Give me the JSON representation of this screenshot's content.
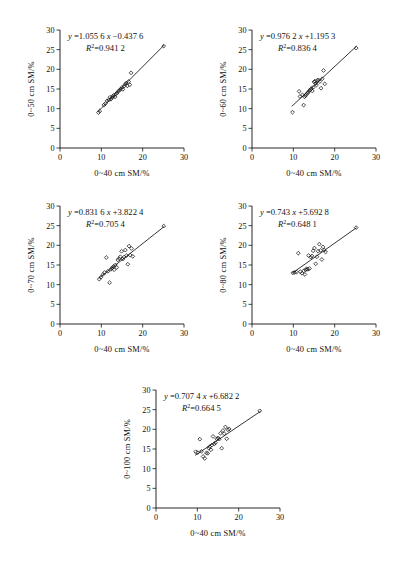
{
  "figure": {
    "background": "#ffffff",
    "ink": "#111111",
    "panel_count": 5
  },
  "axes": {
    "x_ticks": [
      "0",
      "10",
      "20",
      "30"
    ],
    "y_ticks": [
      "0",
      "5",
      "10",
      "15",
      "20",
      "25",
      "30"
    ],
    "x_min": 0,
    "x_max": 30,
    "y_min": 0,
    "y_max": 30,
    "x_label": "0~40 cm  SM/%"
  },
  "chart_data": [
    {
      "type": "scatter",
      "panel": "a",
      "title": "",
      "xlabel": "0~40 cm  SM/%",
      "ylabel": "0~50 cm  SM/%",
      "xlim": [
        0,
        30
      ],
      "ylim": [
        0,
        30
      ],
      "grid": false,
      "legend": "none",
      "equation": "y =1.055 6x −0.437 6",
      "eq_prefix": "y",
      "eq_body": "=1.055 6",
      "eq_var": "x",
      "eq_suffix": "−0.437 6",
      "r2_label": "R",
      "r2_exp": "2",
      "r2_value": "=0.941 2",
      "slope": 1.0556,
      "intercept": -0.4376,
      "r_squared": 0.9412,
      "fit_x_range": [
        9.2,
        25.2
      ],
      "x": [
        9.3,
        9.6,
        10.6,
        11.0,
        11.4,
        11.8,
        12.1,
        12.3,
        12.6,
        12.8,
        13.0,
        13.3,
        13.5,
        13.8,
        14.1,
        14.4,
        14.7,
        15.0,
        15.2,
        15.5,
        15.8,
        16.0,
        16.3,
        16.6,
        16.9,
        17.2,
        25.1
      ],
      "y": [
        9.0,
        9.4,
        10.9,
        11.3,
        12.0,
        12.2,
        12.9,
        12.4,
        12.8,
        13.1,
        13.4,
        13.0,
        13.7,
        14.0,
        14.4,
        14.7,
        15.0,
        15.4,
        14.9,
        15.7,
        16.2,
        16.5,
        15.8,
        16.9,
        16.1,
        19.1,
        25.9
      ]
    },
    {
      "type": "scatter",
      "panel": "b",
      "title": "",
      "xlabel": "0~40 cm  SM/%",
      "ylabel": "0~60 cm  SM/%",
      "xlim": [
        0,
        30
      ],
      "ylim": [
        0,
        30
      ],
      "grid": false,
      "legend": "none",
      "equation": "y =0.976 2x +1.195 3",
      "eq_prefix": "y",
      "eq_body": "=0.976 2",
      "eq_var": "x",
      "eq_suffix": "+1.195 3",
      "r2_label": "R",
      "r2_exp": "2",
      "r2_value": "=0.836 4",
      "slope": 0.9762,
      "intercept": 1.1953,
      "r_squared": 0.8364,
      "fit_x_range": [
        9.6,
        25.3
      ],
      "x": [
        9.8,
        11.4,
        11.6,
        12.2,
        12.5,
        12.7,
        12.9,
        13.1,
        13.4,
        13.6,
        13.9,
        14.2,
        14.4,
        14.6,
        14.8,
        15.0,
        15.2,
        15.4,
        15.6,
        15.8,
        16.1,
        16.4,
        16.7,
        17.0,
        17.3,
        17.6,
        25.2
      ],
      "y": [
        9.1,
        14.4,
        13.1,
        13.5,
        10.9,
        13.0,
        13.3,
        13.6,
        13.9,
        14.2,
        14.6,
        14.9,
        15.1,
        14.5,
        15.4,
        16.8,
        17.0,
        16.4,
        16.0,
        17.2,
        17.3,
        16.9,
        15.2,
        17.6,
        19.7,
        16.3,
        25.4
      ]
    },
    {
      "type": "scatter",
      "panel": "c",
      "title": "",
      "xlabel": "0~40 cm  SM/%",
      "ylabel": "0~70 cm  SM/%",
      "xlim": [
        0,
        30
      ],
      "ylim": [
        0,
        30
      ],
      "grid": false,
      "legend": "none",
      "equation": "y =0.831 6x +3.822 4",
      "eq_prefix": "y",
      "eq_body": "=0.831 6",
      "eq_var": "x",
      "eq_suffix": "+3.822 4",
      "r2_label": "R",
      "r2_exp": "2",
      "r2_value": "=0.705 4",
      "slope": 0.8316,
      "intercept": 3.8224,
      "r_squared": 0.7054,
      "fit_x_range": [
        9.4,
        25.2
      ],
      "x": [
        9.5,
        9.9,
        10.4,
        10.8,
        11.2,
        11.6,
        12.0,
        12.3,
        12.6,
        12.9,
        13.1,
        13.4,
        13.7,
        14.0,
        14.3,
        14.6,
        14.9,
        15.2,
        15.5,
        15.8,
        16.1,
        16.4,
        16.7,
        17.0,
        17.3,
        17.6,
        25.1
      ],
      "y": [
        11.4,
        11.9,
        12.6,
        13.1,
        16.9,
        13.4,
        10.5,
        13.9,
        14.2,
        14.6,
        13.8,
        15.0,
        14.4,
        16.3,
        16.6,
        17.1,
        18.5,
        16.5,
        17.0,
        18.8,
        17.4,
        15.2,
        19.8,
        17.5,
        19.2,
        17.2,
        24.9
      ]
    },
    {
      "type": "scatter",
      "panel": "d",
      "title": "",
      "xlabel": "0~40 cm  SM/%",
      "ylabel": "0~80 cm  SM/%",
      "xlim": [
        0,
        30
      ],
      "ylim": [
        0,
        30
      ],
      "grid": false,
      "legend": "none",
      "equation": "y =0.743x +5.692 8",
      "eq_prefix": "y",
      "eq_body": "=0.743",
      "eq_var": "x",
      "eq_suffix": "+5.692 8",
      "r2_label": "R",
      "r2_exp": "2",
      "r2_value": "=0.648 1",
      "slope": 0.743,
      "intercept": 5.6928,
      "r_squared": 0.6481,
      "fit_x_range": [
        9.8,
        25.3
      ],
      "x": [
        9.9,
        10.3,
        10.8,
        11.2,
        11.7,
        12.1,
        12.5,
        12.8,
        13.0,
        13.2,
        13.5,
        13.7,
        13.9,
        14.2,
        14.5,
        14.8,
        15.1,
        15.4,
        15.7,
        16.0,
        16.3,
        16.6,
        16.9,
        17.2,
        17.5,
        17.8,
        25.2
      ],
      "y": [
        13.0,
        13.1,
        13.2,
        18.0,
        13.3,
        12.9,
        13.5,
        12.6,
        13.8,
        14.0,
        13.9,
        17.4,
        14.1,
        17.0,
        17.3,
        18.6,
        19.3,
        15.3,
        17.1,
        18.5,
        20.3,
        18.7,
        16.4,
        19.6,
        18.8,
        18.3,
        24.5
      ]
    },
    {
      "type": "scatter",
      "panel": "e",
      "title": "",
      "xlabel": "0~40 cm  SM/%",
      "ylabel": "0~100 cm  SM/%",
      "xlim": [
        0,
        30
      ],
      "ylim": [
        0,
        30
      ],
      "grid": false,
      "legend": "none",
      "equation": "y =0.707 4x +6.682 2",
      "eq_prefix": "y",
      "eq_body": "=0.707 4",
      "eq_var": "x",
      "eq_suffix": "+6.682 2",
      "r2_label": "R",
      "r2_exp": "2",
      "r2_value": "=0.664 5",
      "slope": 0.7074,
      "intercept": 6.6822,
      "r_squared": 0.6645,
      "fit_x_range": [
        9.5,
        25.3
      ],
      "x": [
        9.6,
        10.1,
        10.6,
        11.0,
        11.4,
        11.8,
        12.2,
        12.5,
        12.8,
        13.0,
        13.3,
        13.5,
        13.8,
        14.1,
        14.4,
        14.7,
        15.0,
        15.3,
        15.6,
        15.9,
        16.2,
        16.5,
        16.8,
        17.1,
        17.4,
        17.7,
        25.1
      ],
      "y": [
        14.3,
        14.1,
        17.5,
        14.4,
        13.1,
        12.6,
        14.0,
        13.9,
        15.2,
        15.6,
        14.8,
        16.0,
        18.2,
        16.3,
        16.6,
        17.6,
        17.8,
        17.5,
        19.0,
        15.2,
        19.7,
        18.9,
        20.6,
        17.6,
        19.9,
        20.1,
        24.7
      ]
    }
  ]
}
